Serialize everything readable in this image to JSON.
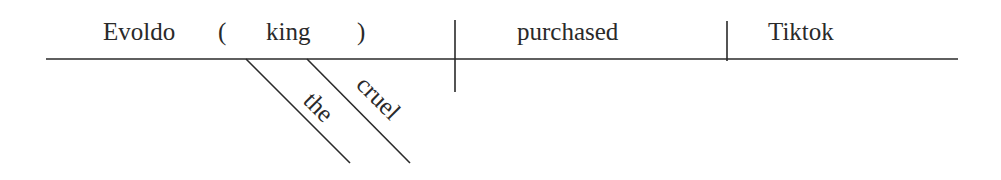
{
  "diagram": {
    "type": "sentence-diagram",
    "subject": {
      "word": "Evoldo",
      "appositive_open": "(",
      "appositive": "king",
      "appositive_close": ")",
      "modifiers": [
        "the",
        "cruel"
      ]
    },
    "verb": "purchased",
    "object": "Tiktok"
  }
}
